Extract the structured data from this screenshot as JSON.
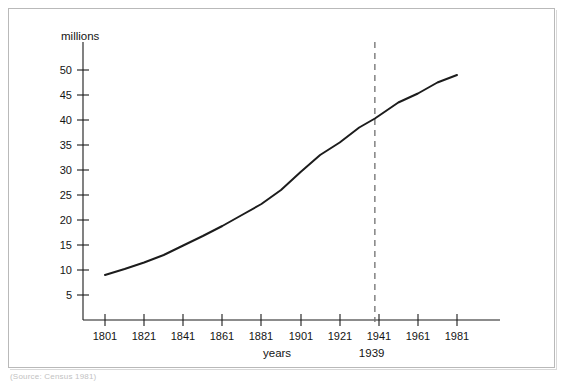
{
  "caption": "(Source: Census 1981)",
  "chart_data": {
    "type": "line",
    "title": "",
    "subtitle": "",
    "xlabel": "years",
    "ylabel": "millions",
    "grid": false,
    "legend": "none",
    "xlim": [
      1801,
      1991
    ],
    "ylim": [
      0,
      52
    ],
    "x_ticks": [
      1801,
      1821,
      1841,
      1861,
      1881,
      1901,
      1921,
      1941,
      1961,
      1981
    ],
    "x_tick_labels": [
      "1801",
      "1821",
      "1841",
      "1861",
      "1881",
      "1901",
      "1921",
      "1941",
      "1961",
      "1981"
    ],
    "y_ticks": [
      5,
      10,
      15,
      20,
      25,
      30,
      35,
      40,
      45,
      50
    ],
    "y_tick_labels": [
      "5",
      "10",
      "15",
      "20",
      "25",
      "30",
      "35",
      "40",
      "45",
      "50"
    ],
    "series": [
      {
        "name": "Population",
        "x": [
          1801,
          1811,
          1821,
          1831,
          1841,
          1851,
          1861,
          1871,
          1881,
          1891,
          1901,
          1911,
          1921,
          1931,
          1939,
          1951,
          1961,
          1971,
          1981
        ],
        "values": [
          9.0,
          10.2,
          11.5,
          13.0,
          14.9,
          16.8,
          18.8,
          21.0,
          23.2,
          26.0,
          29.6,
          33.0,
          35.5,
          38.5,
          40.3,
          43.5,
          45.3,
          47.5,
          49.0
        ]
      }
    ],
    "annotations": [
      {
        "name": "wwii-marker",
        "label": "1939",
        "x": 1939,
        "style": "vertical-dashed"
      }
    ]
  },
  "axis_titles": {
    "y": "millions",
    "x": "years"
  }
}
